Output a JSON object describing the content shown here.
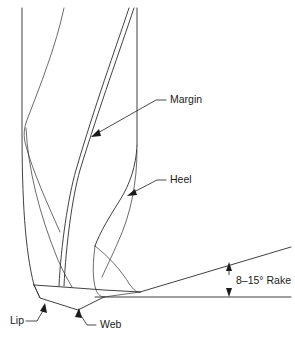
{
  "figure": {
    "background_color": "#ffffff",
    "line_color": "#2b2b2b",
    "text_color": "#1a1a1a",
    "width": 295,
    "height": 345
  },
  "labels": {
    "margin": "Margin",
    "heel": "Heel",
    "lip": "Lip",
    "web": "Web",
    "rake": "8–15° Rake"
  },
  "annotations": [
    {
      "name": "margin",
      "text": "Margin",
      "text_x": 170,
      "text_y": 100,
      "leader": "M166,100 L156,100 L95,135",
      "arrow_x": 92,
      "arrow_y": 137,
      "arrow_angle": 150
    },
    {
      "name": "heel",
      "text": "Heel",
      "text_x": 170,
      "text_y": 180,
      "leader": "M166,180 L157,180 L131,194",
      "arrow_x": 128,
      "arrow_y": 196,
      "arrow_angle": 152
    },
    {
      "name": "lip",
      "text": "Lip",
      "text_x": 10,
      "text_y": 321,
      "leader": "M25,321 L36,321 L44,308",
      "arrow_x": 42,
      "arrow_y": 304,
      "arrow_angle": 303
    },
    {
      "name": "web",
      "text": "Web",
      "text_x": 99,
      "text_y": 325,
      "leader": "M95,325 L86,325 L80,313",
      "arrow_x": 79,
      "arrow_y": 309,
      "arrow_angle": 296
    }
  ],
  "rake_dimension": {
    "label": "8–15° Rake",
    "label_x": 236,
    "label_y": 281,
    "min_angle_deg": 8,
    "max_angle_deg": 15,
    "arrow_x": 229,
    "up_arrow_tip_y": 263,
    "down_arrow_tip_y": 296
  },
  "geometry": {
    "body_left_edge_x": 22,
    "body_right_edge_x": 137,
    "point_tip_x": 140,
    "point_tip_y": 292,
    "baseline_y": 297,
    "baseline_x_start": 95,
    "baseline_x_end": 291,
    "rake_line_x_end": 291,
    "rake_line_y_end": 247
  }
}
